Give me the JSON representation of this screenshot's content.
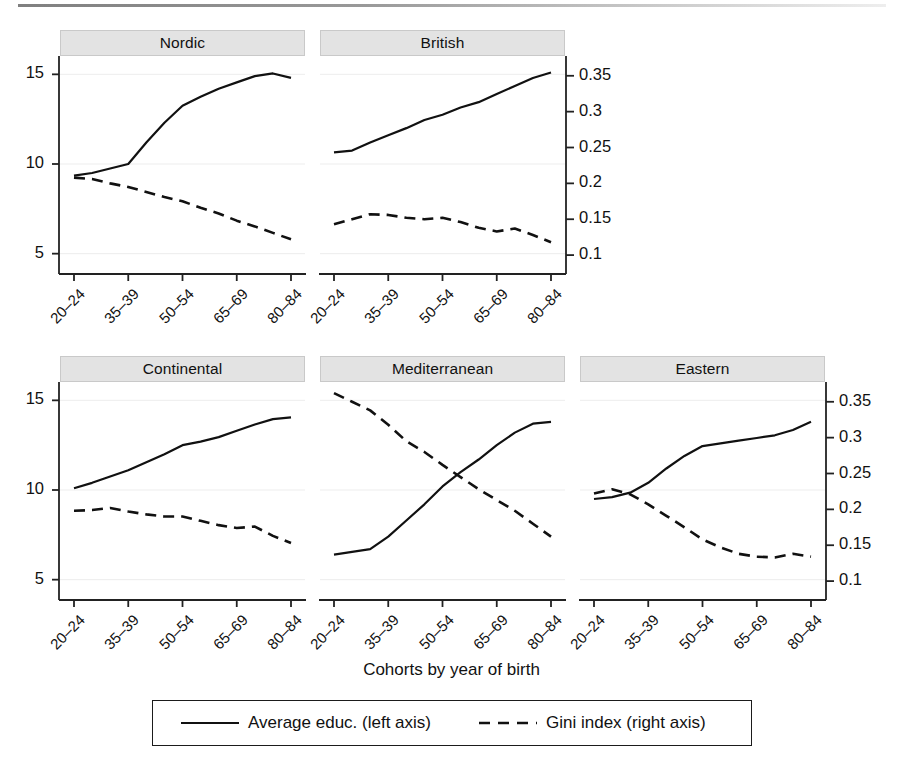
{
  "figure": {
    "xaxis_title": "Cohorts by year of birth",
    "left_axis_ticks": [
      "15",
      "10",
      "5"
    ],
    "right_axis_ticks": [
      "0.35",
      "0.3",
      "0.25",
      "0.2",
      "0.15",
      "0.1"
    ],
    "xtick_labels": [
      "20–24",
      "35–39",
      "50–54",
      "65–69",
      "80–84"
    ],
    "panel_titles": [
      "Nordic",
      "British",
      "Continental",
      "Mediterranean",
      "Eastern"
    ],
    "legend": {
      "solid_label": "Average educ. (left axis)",
      "dashed_label": "Gini index (right axis)"
    },
    "colors": {
      "line": "#111111",
      "header_fill": "#e3e3e3",
      "header_border": "#c9c9c9",
      "grid": "#ededed",
      "axis": "#222222"
    }
  },
  "chart_data": {
    "type": "line",
    "title": "",
    "subtitle": "",
    "xlabel": "Cohorts by year of birth",
    "ylabel_left": "Average educ. (left axis)",
    "ylabel_right": "Gini index (right axis)",
    "ylim_left": [
      4.2,
      15.8
    ],
    "ylim_right": [
      0.082,
      0.372
    ],
    "left_ticks": [
      15,
      10,
      5
    ],
    "right_ticks": [
      0.35,
      0.3,
      0.25,
      0.2,
      0.15,
      0.1
    ],
    "grid": true,
    "legend_position": "bottom",
    "x_tick_labels": [
      "20-24",
      "35-39",
      "50-54",
      "65-69",
      "80-84"
    ],
    "x": [
      1,
      2,
      3,
      4,
      5,
      6,
      7,
      8,
      9,
      10,
      11,
      12,
      13
    ],
    "x_positions_labeled": [
      1,
      4,
      7,
      10,
      13
    ],
    "panels": [
      {
        "name": "Nordic",
        "row": 0,
        "col": 0,
        "series": [
          {
            "name": "Average educ. (left axis)",
            "axis": "left",
            "style": "solid",
            "values": [
              9.35,
              9.5,
              9.75,
              10.0,
              11.2,
              12.3,
              13.25,
              13.75,
              14.2,
              14.55,
              14.9,
              15.05,
              14.8
            ]
          },
          {
            "name": "Gini index (right axis)",
            "axis": "right",
            "style": "dashed",
            "values": [
              0.208,
              0.206,
              0.2,
              0.195,
              0.188,
              0.181,
              0.175,
              0.166,
              0.158,
              0.148,
              0.14,
              0.131,
              0.122
            ]
          }
        ]
      },
      {
        "name": "British",
        "row": 0,
        "col": 1,
        "series": [
          {
            "name": "Average educ. (left axis)",
            "axis": "left",
            "style": "solid",
            "values": [
              10.65,
              10.75,
              11.2,
              11.6,
              12.0,
              12.45,
              12.75,
              13.15,
              13.45,
              13.9,
              14.35,
              14.8,
              15.1
            ]
          },
          {
            "name": "Gini index (right axis)",
            "axis": "right",
            "style": "dashed",
            "values": [
              0.143,
              0.15,
              0.157,
              0.156,
              0.152,
              0.15,
              0.152,
              0.146,
              0.138,
              0.133,
              0.137,
              0.128,
              0.118
            ]
          }
        ]
      },
      {
        "name": "Continental",
        "row": 1,
        "col": 0,
        "series": [
          {
            "name": "Average educ. (left axis)",
            "axis": "left",
            "style": "solid",
            "values": [
              10.1,
              10.4,
              10.75,
              11.1,
              11.55,
              12.0,
              12.5,
              12.7,
              12.95,
              13.3,
              13.65,
              13.95,
              14.05
            ]
          },
          {
            "name": "Gini index (right axis)",
            "axis": "right",
            "style": "dashed",
            "values": [
              0.198,
              0.199,
              0.202,
              0.197,
              0.193,
              0.19,
              0.19,
              0.184,
              0.178,
              0.174,
              0.176,
              0.163,
              0.153
            ]
          }
        ]
      },
      {
        "name": "Mediterranean",
        "row": 1,
        "col": 1,
        "series": [
          {
            "name": "Average educ. (left axis)",
            "axis": "left",
            "style": "solid",
            "values": [
              6.4,
              6.55,
              6.7,
              7.4,
              8.3,
              9.2,
              10.2,
              11.0,
              11.7,
              12.5,
              13.2,
              13.7,
              13.8
            ]
          },
          {
            "name": "Gini index (right axis)",
            "axis": "right",
            "style": "dashed",
            "values": [
              0.362,
              0.35,
              0.338,
              0.318,
              0.295,
              0.28,
              0.262,
              0.245,
              0.228,
              0.213,
              0.198,
              0.18,
              0.162
            ]
          }
        ]
      },
      {
        "name": "Eastern",
        "row": 1,
        "col": 2,
        "series": [
          {
            "name": "Average educ. (left axis)",
            "axis": "left",
            "style": "solid",
            "values": [
              9.5,
              9.6,
              9.85,
              10.4,
              11.2,
              11.9,
              12.45,
              12.6,
              12.75,
              12.9,
              13.05,
              13.35,
              13.8
            ]
          },
          {
            "name": "Gini index (right axis)",
            "axis": "right",
            "style": "dashed",
            "values": [
              0.222,
              0.228,
              0.221,
              0.207,
              0.191,
              0.175,
              0.158,
              0.147,
              0.138,
              0.134,
              0.133,
              0.138,
              0.134
            ]
          }
        ]
      }
    ]
  }
}
